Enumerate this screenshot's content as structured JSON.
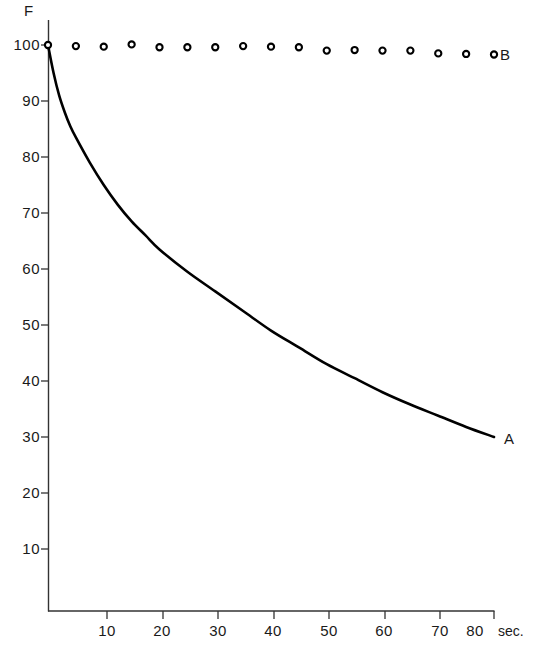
{
  "chart_data": {
    "type": "line",
    "title": "",
    "xlabel": "sec.",
    "ylabel": "F",
    "xlim": [
      0,
      80
    ],
    "ylim": [
      0,
      103
    ],
    "grid": false,
    "x_ticks": [
      10,
      20,
      30,
      40,
      50,
      60,
      70,
      80
    ],
    "y_ticks": [
      10,
      20,
      30,
      40,
      50,
      60,
      70,
      80,
      90,
      100
    ],
    "x_tick_labels": [
      "10",
      "20",
      "30",
      "40",
      "50",
      "60",
      "70",
      "80"
    ],
    "y_tick_labels": [
      "10",
      "20",
      "30",
      "40",
      "50",
      "60",
      "70",
      "80",
      "90",
      "100"
    ],
    "legend_position": "inline-right",
    "series": [
      {
        "name": "A",
        "label": "A",
        "marker": "none",
        "style": "solid-curve",
        "color": "#000000",
        "x": [
          0,
          1,
          2,
          3,
          4,
          5,
          7.5,
          10,
          12.5,
          15,
          17.5,
          20,
          25,
          30,
          35,
          40,
          45,
          50,
          55,
          60,
          65,
          70,
          75,
          80
        ],
        "values": [
          100,
          95,
          91,
          88,
          85.5,
          83.5,
          79,
          75,
          71.5,
          68.5,
          66,
          63.5,
          59.5,
          56,
          52.5,
          49,
          46,
          43,
          40.5,
          38,
          35.8,
          33.8,
          31.8,
          30
        ]
      },
      {
        "name": "B",
        "label": "B",
        "marker": "open-circle",
        "style": "markers-only",
        "color": "#000000",
        "x": [
          0,
          5,
          10,
          15,
          20,
          25,
          30,
          35,
          40,
          45,
          50,
          55,
          60,
          65,
          70,
          75,
          80
        ],
        "values": [
          100,
          99.8,
          99.7,
          100.1,
          99.6,
          99.6,
          99.6,
          99.8,
          99.7,
          99.6,
          99.0,
          99.1,
          99.0,
          99.0,
          98.5,
          98.4,
          98.3
        ]
      }
    ]
  },
  "axes": {
    "y_axis_title": "F",
    "x_axis_unit": "sec."
  },
  "labels": {
    "series_a": "A",
    "series_b": "B"
  }
}
